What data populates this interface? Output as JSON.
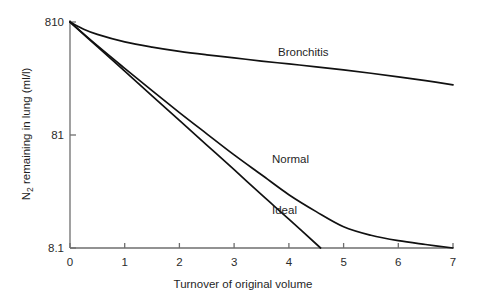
{
  "chart_data": {
    "type": "line",
    "title": "",
    "xlabel": "Turnover of original volume",
    "ylabel": "N2 remaining in lung (ml/l)",
    "ylabel_parts": {
      "base": "N",
      "subscript": "2",
      "rest": " remaining in lung (ml/l)"
    },
    "xlim": [
      0,
      7
    ],
    "ylim": [
      8.1,
      810
    ],
    "yscale": "log",
    "xscale": "linear",
    "grid": false,
    "legend": "inline-labels",
    "xticks": [
      "0",
      "1",
      "2",
      "3",
      "4",
      "5",
      "6",
      "7"
    ],
    "xtick_values": [
      0,
      1,
      2,
      3,
      4,
      5,
      6,
      7
    ],
    "yticks": [
      "810",
      "81",
      "8.1"
    ],
    "ytick_values": [
      810,
      81,
      8.1
    ],
    "series": [
      {
        "name": "Bronchitis",
        "label": "Bronchitis",
        "x": [
          0,
          0.25,
          0.5,
          1,
          1.5,
          2,
          2.5,
          3,
          3.5,
          4,
          4.5,
          5,
          5.5,
          6,
          6.5,
          7
        ],
        "values": [
          810,
          700,
          630,
          540,
          485,
          445,
          415,
          390,
          365,
          345,
          325,
          305,
          285,
          265,
          245,
          225
        ]
      },
      {
        "name": "Normal",
        "label": "Normal",
        "x": [
          0,
          0.5,
          1,
          1.5,
          2,
          2.5,
          3,
          3.5,
          4,
          4.5,
          5,
          5.5,
          6,
          6.5,
          7
        ],
        "values": [
          810,
          500,
          315,
          200,
          128,
          83,
          54,
          36,
          24,
          17,
          12.5,
          10.5,
          9.4,
          8.7,
          8.1
        ]
      },
      {
        "name": "Ideal",
        "label": "Ideal",
        "x": [
          0,
          0.5,
          1,
          1.5,
          2,
          2.5,
          3,
          3.5,
          4,
          4.58
        ],
        "values": [
          810,
          490,
          297,
          180,
          109,
          66,
          40,
          24,
          14.6,
          8.1
        ]
      }
    ],
    "series_label_positions": [
      {
        "name": "Bronchitis",
        "x_px": 278,
        "y_px": 56
      },
      {
        "name": "Normal",
        "x_px": 272,
        "y_px": 163
      },
      {
        "name": "Ideal",
        "x_px": 272,
        "y_px": 214
      }
    ],
    "colors": {
      "curve": "#111111",
      "axis": "#6e6e6e",
      "text": "#1f1f1f",
      "background": "#ffffff"
    }
  }
}
